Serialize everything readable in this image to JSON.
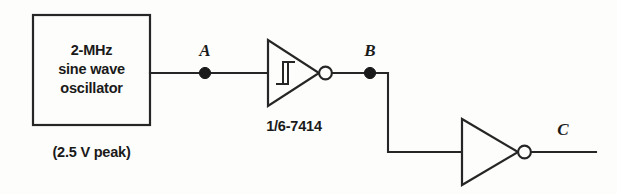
{
  "diagram": {
    "background_color": "#fdfdfb",
    "line_color": "#262626",
    "source_block": {
      "line1": "2-MHz",
      "line2": "sine wave",
      "line3": "oscillator",
      "caption": "(2.5 V peak)"
    },
    "gates": {
      "schmitt_inverter": {
        "part_label": "1/6-7414",
        "symbol": "schmitt-hysteresis",
        "inverting": true
      },
      "plain_inverter": {
        "part_label": "",
        "symbol": "inverter-triangle",
        "inverting": true
      }
    },
    "nodes": {
      "a": "A",
      "b": "B",
      "c": "C"
    }
  }
}
